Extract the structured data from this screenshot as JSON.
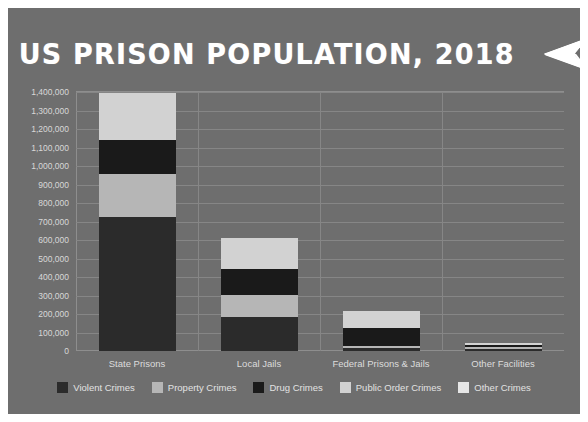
{
  "figure": {
    "background_color": "#6e6e6e",
    "page_background": "#ffffff",
    "title": "US PRISON POPULATION, 2018",
    "title_arrow_icon": "left-arrow-dart-icon"
  },
  "chart_data": {
    "type": "bar",
    "subtype": "stacked-bar",
    "title": "US PRISON POPULATION, 2018",
    "xlabel": "",
    "ylabel": "",
    "ylim": [
      0,
      1400000
    ],
    "grid": true,
    "legend_position": "bottom",
    "categories": [
      "State Prisons",
      "Local Jails",
      "Federal Prisons & Jails",
      "Other Facilities"
    ],
    "ytick_labels": [
      "1,400,000",
      "1,300,000",
      "1,200,000",
      "1,100,000",
      "1,000,000",
      "900,000",
      "800,000",
      "700,000",
      "600,000",
      "500,000",
      "400,000",
      "300,000",
      "200,000",
      "100,000",
      "0"
    ],
    "ytick_values": [
      1400000,
      1300000,
      1200000,
      1100000,
      1000000,
      900000,
      800000,
      700000,
      600000,
      500000,
      400000,
      300000,
      200000,
      100000,
      0
    ],
    "series": [
      {
        "name": "Violent Crimes",
        "color": "#2b2b2b",
        "values": [
          725000,
          185000,
          15000,
          12000
        ]
      },
      {
        "name": "Property Crimes",
        "color": "#b6b6b6",
        "values": [
          230000,
          120000,
          12000,
          10000
        ]
      },
      {
        "name": "Drug Crimes",
        "color": "#1a1a1a",
        "values": [
          185000,
          140000,
          100000,
          12000
        ]
      },
      {
        "name": "Public Order Crimes",
        "color": "#d2d2d2",
        "values": [
          255000,
          165000,
          90000,
          11000
        ]
      },
      {
        "name": "Other Crimes",
        "color": "#e6e6e6",
        "values": [
          0,
          0,
          0,
          0
        ]
      }
    ],
    "totals": [
      1395000,
      610000,
      217000,
      45000
    ],
    "colors": {
      "violent": "#2b2b2b",
      "property": "#b6b6b6",
      "drug": "#1a1a1a",
      "public_order": "#d2d2d2",
      "other": "#e6e6e6",
      "grid": "#868686",
      "axis": "#8e8e8e",
      "tick_text": "#d8d8d8",
      "legend_text": "#e2e2e2",
      "title_text": "#ffffff"
    }
  }
}
